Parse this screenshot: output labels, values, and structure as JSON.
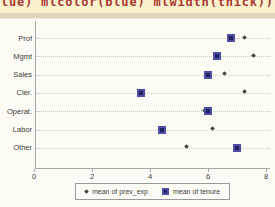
{
  "code_line": "lue) mlcolor(blue) mlwidth(thick))",
  "colors": {
    "page_bg": "#faf1cf",
    "divider": "#e0d6bd",
    "graph_bg": "#fcfbf4",
    "code_text": "#a8392e",
    "axis": "#a3a8a3",
    "grid": "#c9c9c4",
    "text": "#3d3d3d",
    "diamond_fill": "#56564c",
    "diamond_edge": "#3f3f37",
    "square_fill": "#23235e",
    "square_edge": "#4e4ea8",
    "legend_border": "#9a9a9a"
  },
  "chart_data": {
    "type": "scatter",
    "subtype": "horizontal-dot-plot",
    "title": "",
    "xlabel": "",
    "ylabel": "",
    "categories": [
      "Prof",
      "Mgmt",
      "Sales",
      "Cler.",
      "Operat.",
      "Labor",
      "Other"
    ],
    "series": [
      {
        "name": "mean of prev_exp",
        "marker": "diamond",
        "color": "#56564c",
        "values": [
          7.3,
          7.6,
          6.6,
          7.3,
          5.9,
          6.2,
          5.3
        ]
      },
      {
        "name": "mean of tenure",
        "marker": "square",
        "color": "#23235e",
        "border_color": "#4e4ea8",
        "values": [
          6.8,
          6.3,
          6.0,
          3.7,
          6.0,
          4.4,
          7.0
        ]
      }
    ],
    "xlim": [
      0,
      8
    ],
    "xticks": [
      "0",
      "2",
      "4",
      "6",
      "8"
    ],
    "grid": "dotted-horizontal",
    "legend_position": "bottom-center"
  },
  "legend": {
    "items": [
      {
        "icon": "diamond-marker-icon",
        "label": "mean of prev_exp"
      },
      {
        "icon": "square-marker-icon",
        "label": "mean of tenure"
      }
    ]
  }
}
